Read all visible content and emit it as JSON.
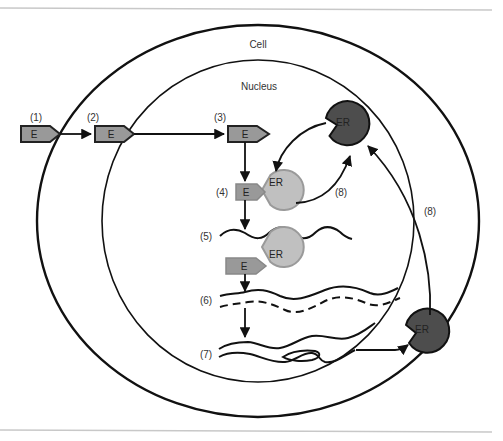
{
  "diagram": {
    "compartments": {
      "cell": "Cell",
      "nucleus": "Nucleus"
    },
    "molecules": {
      "ligand": "E",
      "receptor": "ER"
    },
    "steps": [
      "(1)",
      "(2)",
      "(3)",
      "(4)",
      "(5)",
      "(6)",
      "(7)",
      "(8)",
      "(8)"
    ],
    "colors": {
      "ligand_fill": "#999999",
      "receptor_bound_fill": "#c0c0c0",
      "receptor_bound_stroke": "#9a9a9a",
      "receptor_free_fill": "#4d4d4d",
      "line": "#111111",
      "frame_line": "#c8c8c8"
    }
  }
}
